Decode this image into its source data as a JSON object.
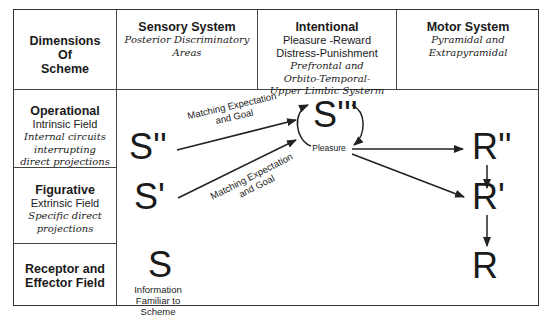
{
  "header": {
    "corner": [
      "Dimensions",
      "Of",
      "Scheme"
    ],
    "columns": [
      {
        "title": "Sensory System",
        "lines": [
          {
            "text": "Posterior Discriminatory",
            "style": "italic"
          },
          {
            "text": "Areas",
            "style": "italic"
          }
        ]
      },
      {
        "title": "Intentional",
        "lines": [
          {
            "text": "Pleasure -Reward",
            "style": "plain"
          },
          {
            "text": "Distress-Punishment",
            "style": "plain"
          },
          {
            "text": "Prefrontal and",
            "style": "italic"
          },
          {
            "text": "Orbito-Temporal-",
            "style": "italic"
          },
          {
            "text": "Upper Limbic Systerm",
            "style": "italic"
          }
        ]
      },
      {
        "title": "Motor System",
        "lines": [
          {
            "text": "Pyramidal and",
            "style": "italic"
          },
          {
            "text": "Extrapyramidal",
            "style": "italic"
          }
        ]
      }
    ]
  },
  "rows": [
    {
      "title": "Operational",
      "subtitle": "Intrinsic Field",
      "notes": [
        "Internal circuits",
        "interrupting",
        "direct projections"
      ]
    },
    {
      "title": "Figurative",
      "subtitle": "Extrinsic Field",
      "notes": [
        "Specific direct",
        "projections"
      ]
    },
    {
      "title_lines": [
        "Receptor and",
        "Effector Field"
      ]
    }
  ],
  "diagram": {
    "nodes": {
      "s_double": "S''",
      "s_single": "S'",
      "s_base": "S",
      "s_triple": "S'''",
      "r_double": "R''",
      "r_single": "R'",
      "r_base": "R"
    },
    "labels": {
      "upper_arrow": [
        "Matching Expectation",
        "and Goal"
      ],
      "lower_arrow": [
        "Matching Expectation",
        "and Goal"
      ],
      "pleasure": "Pleasure",
      "s_caption": [
        "Information",
        "Familiar to",
        "Scheme"
      ]
    },
    "colors": {
      "line": "#222222",
      "border": "#333333"
    }
  }
}
